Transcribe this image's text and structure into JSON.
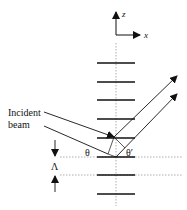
{
  "diagram": {
    "axes": {
      "z_label": "z",
      "x_label": "x"
    },
    "incident_label_line1": "Incident",
    "incident_label_line2": "beam",
    "angle_incident": "θ",
    "angle_reflected": "θ′",
    "period_label": "Λ",
    "layers_count": 8,
    "colors": {
      "line": "#111111",
      "dotted": "#888888",
      "background": "#ffffff"
    }
  }
}
